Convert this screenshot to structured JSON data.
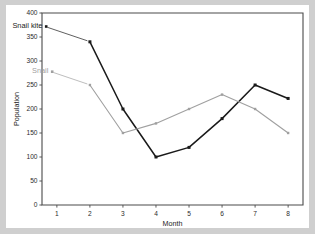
{
  "chart_data": {
    "type": "line",
    "title": "",
    "xlabel": "Month",
    "ylabel": "Population",
    "x": [
      1,
      2,
      3,
      4,
      5,
      6,
      7,
      8
    ],
    "xticklabels": [
      "1",
      "2",
      "3",
      "4",
      "5",
      "6",
      "7",
      "8"
    ],
    "xlim": [
      0.55,
      8.45
    ],
    "ylim": [
      0,
      400
    ],
    "yticks": [
      0,
      50,
      100,
      150,
      200,
      250,
      300,
      350,
      400
    ],
    "yticklabels": [
      "0",
      "50",
      "100",
      "150",
      "200",
      "250",
      "300",
      "350",
      "400"
    ],
    "grid": false,
    "legend": "inline-labels",
    "series": [
      {
        "name": "Snail kite",
        "color": "#1a1a1a",
        "marker": "square",
        "x": [
          2,
          3,
          4,
          5,
          6,
          7,
          8
        ],
        "values": [
          340,
          200,
          100,
          120,
          180,
          250,
          222
        ]
      },
      {
        "name": "Snail",
        "color": "#a0a0a0",
        "marker": "square",
        "x": [
          2,
          3,
          4,
          5,
          6,
          7,
          8
        ],
        "values": [
          250,
          150,
          170,
          200,
          230,
          200,
          150
        ]
      }
    ],
    "annotations": [
      {
        "text": "Snail kite",
        "color": "#1a1a1a",
        "anchor_x": 2,
        "anchor_y": 340
      },
      {
        "text": "Snail",
        "color": "#a0a0a0",
        "anchor_x": 2,
        "anchor_y": 250
      }
    ]
  }
}
